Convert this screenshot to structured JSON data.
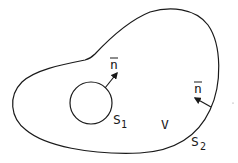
{
  "diagram": {
    "stroke_color": "#1a1a1a",
    "background": "#ffffff",
    "outer_surface": {
      "label": "S",
      "subscript": "2"
    },
    "inner_surface": {
      "label": "S",
      "subscript": "1"
    },
    "volume": {
      "label": "V"
    },
    "normal_inner": {
      "label": "n",
      "overbar": true
    },
    "normal_outer": {
      "label": "n",
      "overbar": true
    }
  }
}
